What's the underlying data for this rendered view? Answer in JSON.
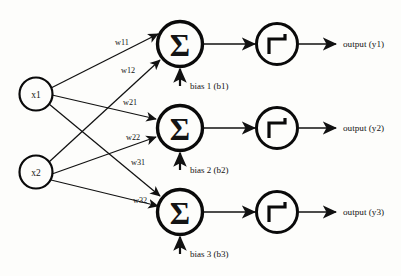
{
  "diagram": {
    "background_color": "#fdfdfb",
    "stroke_color": "#111111"
  },
  "inputs": [
    {
      "label": "x1",
      "name": "input-node-x1"
    },
    {
      "label": "x2",
      "name": "input-node-x2"
    }
  ],
  "summation_glyph": "Σ",
  "neurons": [
    {
      "sum_label": "Σ",
      "bias_label": "bias 1 (b1)",
      "output_label": "output (y1)"
    },
    {
      "sum_label": "Σ",
      "bias_label": "bias 2 (b2)",
      "output_label": "output (y2)"
    },
    {
      "sum_label": "Σ",
      "bias_label": "bias 3 (b3)",
      "output_label": "output (y3)"
    }
  ],
  "weights": [
    {
      "label": "w11",
      "from": "x1",
      "to": "neuron-1"
    },
    {
      "label": "w12",
      "from": "x2",
      "to": "neuron-1"
    },
    {
      "label": "w21",
      "from": "x1",
      "to": "neuron-2"
    },
    {
      "label": "w22",
      "from": "x2",
      "to": "neuron-2"
    },
    {
      "label": "w31",
      "from": "x1",
      "to": "neuron-3"
    },
    {
      "label": "w32",
      "from": "x2",
      "to": "neuron-3"
    }
  ],
  "activation": {
    "glyph_name": "step-function",
    "description": "Heaviside step function"
  }
}
